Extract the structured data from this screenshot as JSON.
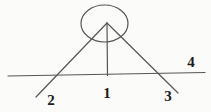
{
  "diagram": {
    "background_color": "#fbfbfa",
    "stroke_color": "#555555",
    "label_color": "#1c1c1c",
    "labels": {
      "line1": "1",
      "line2": "2",
      "line3": "3",
      "line4": "4"
    }
  }
}
